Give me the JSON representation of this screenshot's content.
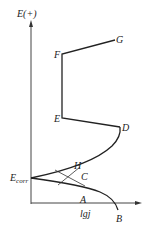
{
  "figure": {
    "y_axis_label": "E(+)",
    "x_axis_label": "lgj",
    "corrosion_potential_label": "E",
    "corrosion_potential_subscript": "corr",
    "points": {
      "A": "A",
      "B": "B",
      "C": "C",
      "D": "D",
      "E": "E",
      "F": "F",
      "G": "G",
      "H": "H"
    }
  },
  "colors": {
    "line": "#222222",
    "background": "#ffffff"
  }
}
